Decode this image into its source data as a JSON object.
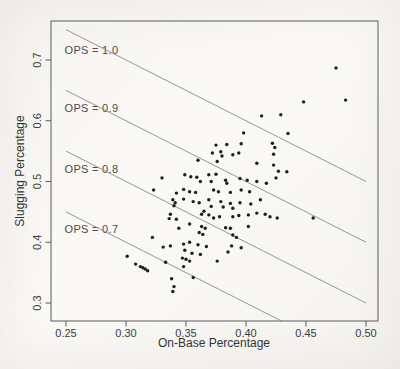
{
  "figure": {
    "background_color": "#f7f6f3",
    "axis_color": "#5a5a5a",
    "text_color": "#3b3b3b",
    "point_color": "#1f1f1f",
    "ref_line_color": "#8a8a8a"
  },
  "chart_data": {
    "type": "scatter",
    "title": "",
    "xlabel": "On-Base Percentage",
    "ylabel": "Slugging Percentage",
    "x_ticks": [
      0.25,
      0.3,
      0.35,
      0.4,
      0.45,
      0.5
    ],
    "x_tick_labels": [
      "0.25",
      "0.30",
      "0.35",
      "0.40",
      "0.45",
      "0.50"
    ],
    "y_ticks": [
      0.3,
      0.4,
      0.5,
      0.6,
      0.7
    ],
    "y_tick_labels": [
      "0.3",
      "0.4",
      "0.5",
      "0.6",
      "0.7"
    ],
    "xlim": [
      0.2375,
      0.51
    ],
    "ylim": [
      0.2704,
      0.7642
    ],
    "grid": false,
    "legend_position": "none",
    "reference_lines": [
      {
        "label": "OPS = 1.0",
        "ops": 1.0,
        "x_from": 0.25,
        "x_to": 0.5,
        "label_x": 0.2712,
        "label_y": 0.7164
      },
      {
        "label": "OPS = 0.9",
        "ops": 0.9,
        "x_from": 0.25,
        "x_to": 0.5,
        "label_x": 0.2712,
        "label_y": 0.6202
      },
      {
        "label": "OPS = 0.8",
        "ops": 0.8,
        "x_from": 0.25,
        "x_to": 0.5,
        "label_x": 0.2712,
        "label_y": 0.5214
      },
      {
        "label": "OPS = 0.7",
        "ops": 0.7,
        "x_from": 0.25,
        "x_to": 0.5,
        "label_x": 0.2712,
        "label_y": 0.4226
      }
    ],
    "points": [
      [
        0.33,
        0.506
      ],
      [
        0.413,
        0.608
      ],
      [
        0.398,
        0.58
      ],
      [
        0.422,
        0.563
      ],
      [
        0.424,
        0.556
      ],
      [
        0.375,
        0.56
      ],
      [
        0.384,
        0.561
      ],
      [
        0.396,
        0.562
      ],
      [
        0.475,
        0.687
      ],
      [
        0.448,
        0.631
      ],
      [
        0.483,
        0.634
      ],
      [
        0.429,
        0.61
      ],
      [
        0.435,
        0.579
      ],
      [
        0.423,
        0.545
      ],
      [
        0.427,
        0.517
      ],
      [
        0.434,
        0.516
      ],
      [
        0.425,
        0.506
      ],
      [
        0.372,
        0.547
      ],
      [
        0.379,
        0.549
      ],
      [
        0.38,
        0.542
      ],
      [
        0.389,
        0.544
      ],
      [
        0.394,
        0.547
      ],
      [
        0.36,
        0.535
      ],
      [
        0.376,
        0.533
      ],
      [
        0.409,
        0.53
      ],
      [
        0.423,
        0.527
      ],
      [
        0.349,
        0.511
      ],
      [
        0.354,
        0.508
      ],
      [
        0.359,
        0.507
      ],
      [
        0.369,
        0.511
      ],
      [
        0.375,
        0.512
      ],
      [
        0.362,
        0.5
      ],
      [
        0.371,
        0.5
      ],
      [
        0.383,
        0.502
      ],
      [
        0.384,
        0.497
      ],
      [
        0.395,
        0.505
      ],
      [
        0.401,
        0.502
      ],
      [
        0.409,
        0.5
      ],
      [
        0.417,
        0.497
      ],
      [
        0.348,
        0.487
      ],
      [
        0.353,
        0.483
      ],
      [
        0.358,
        0.482
      ],
      [
        0.373,
        0.486
      ],
      [
        0.377,
        0.483
      ],
      [
        0.387,
        0.482
      ],
      [
        0.396,
        0.486
      ],
      [
        0.403,
        0.483
      ],
      [
        0.348,
        0.471
      ],
      [
        0.356,
        0.467
      ],
      [
        0.361,
        0.465
      ],
      [
        0.369,
        0.47
      ],
      [
        0.379,
        0.467
      ],
      [
        0.387,
        0.464
      ],
      [
        0.395,
        0.465
      ],
      [
        0.404,
        0.463
      ],
      [
        0.412,
        0.47
      ],
      [
        0.371,
        0.459
      ],
      [
        0.381,
        0.458
      ],
      [
        0.389,
        0.456
      ],
      [
        0.323,
        0.486
      ],
      [
        0.342,
        0.481
      ],
      [
        0.339,
        0.47
      ],
      [
        0.341,
        0.465
      ],
      [
        0.34,
        0.46
      ],
      [
        0.337,
        0.446
      ],
      [
        0.336,
        0.439
      ],
      [
        0.342,
        0.438
      ],
      [
        0.344,
        0.423
      ],
      [
        0.322,
        0.408
      ],
      [
        0.337,
        0.394
      ],
      [
        0.333,
        0.367
      ],
      [
        0.301,
        0.377
      ],
      [
        0.308,
        0.364
      ],
      [
        0.312,
        0.36
      ],
      [
        0.314,
        0.358
      ],
      [
        0.316,
        0.356
      ],
      [
        0.318,
        0.353
      ],
      [
        0.338,
        0.34
      ],
      [
        0.34,
        0.327
      ],
      [
        0.339,
        0.319
      ],
      [
        0.331,
        0.392
      ],
      [
        0.348,
        0.397
      ],
      [
        0.347,
        0.374
      ],
      [
        0.348,
        0.36
      ],
      [
        0.349,
        0.387
      ],
      [
        0.365,
        0.451
      ],
      [
        0.363,
        0.446
      ],
      [
        0.369,
        0.445
      ],
      [
        0.373,
        0.44
      ],
      [
        0.378,
        0.442
      ],
      [
        0.389,
        0.442
      ],
      [
        0.394,
        0.444
      ],
      [
        0.402,
        0.445
      ],
      [
        0.409,
        0.448
      ],
      [
        0.416,
        0.446
      ],
      [
        0.42,
        0.442
      ],
      [
        0.353,
        0.43
      ],
      [
        0.363,
        0.426
      ],
      [
        0.366,
        0.423
      ],
      [
        0.383,
        0.424
      ],
      [
        0.387,
        0.423
      ],
      [
        0.402,
        0.426
      ],
      [
        0.361,
        0.416
      ],
      [
        0.364,
        0.413
      ],
      [
        0.389,
        0.412
      ],
      [
        0.392,
        0.408
      ],
      [
        0.353,
        0.4
      ],
      [
        0.36,
        0.396
      ],
      [
        0.367,
        0.393
      ],
      [
        0.388,
        0.394
      ],
      [
        0.396,
        0.391
      ],
      [
        0.355,
        0.382
      ],
      [
        0.362,
        0.38
      ],
      [
        0.35,
        0.372
      ],
      [
        0.353,
        0.369
      ],
      [
        0.376,
        0.369
      ],
      [
        0.385,
        0.384
      ],
      [
        0.356,
        0.342
      ],
      [
        0.426,
        0.44
      ],
      [
        0.456,
        0.44
      ]
    ]
  }
}
